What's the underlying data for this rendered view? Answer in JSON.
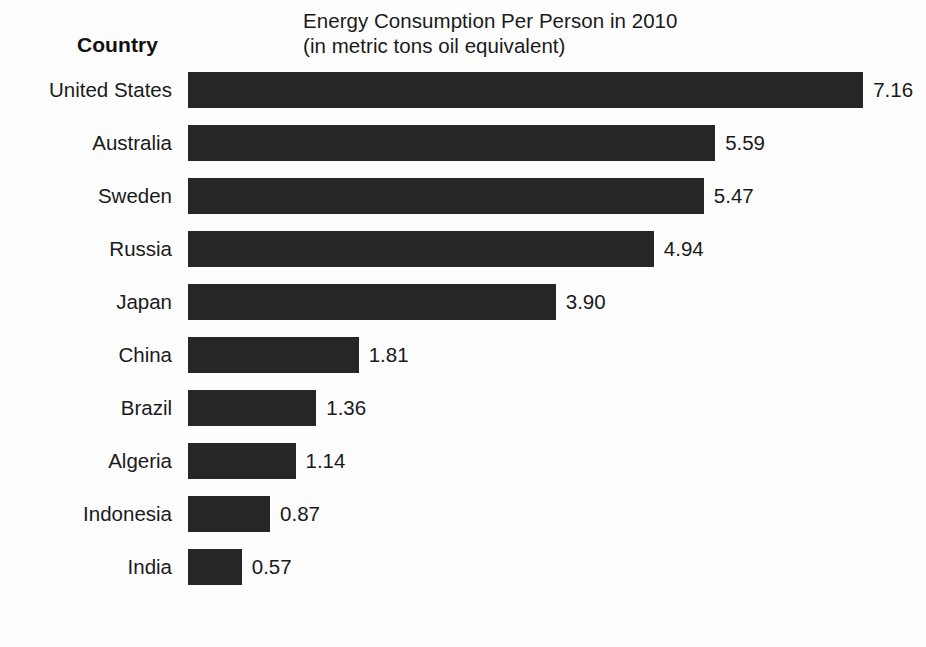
{
  "header": {
    "axis_header": "Country",
    "title_line1": "Energy Consumption Per Person in 2010",
    "title_line2": "(in metric tons oil equivalent)"
  },
  "style": {
    "bar_color": "#262626",
    "background_color": "#fdfdfd",
    "text_color": "#1a1a1a"
  },
  "chart_data": {
    "type": "bar",
    "orientation": "horizontal",
    "title": "Energy Consumption Per Person in 2010",
    "subtitle": "(in metric tons oil equivalent)",
    "xlabel": "",
    "ylabel": "Country",
    "grid": false,
    "legend": false,
    "axis_visible": false,
    "value_labels": true,
    "xlim": [
      0,
      7.16
    ],
    "categories": [
      "United States",
      "Australia",
      "Sweden",
      "Russia",
      "Japan",
      "China",
      "Brazil",
      "Algeria",
      "Indonesia",
      "India"
    ],
    "values": [
      7.16,
      5.59,
      5.47,
      4.94,
      3.9,
      1.81,
      1.36,
      1.14,
      0.87,
      0.57
    ],
    "value_labels_text": [
      "7.16",
      "5.59",
      "5.47",
      "4.94",
      "3.90",
      "1.81",
      "1.36",
      "1.14",
      "0.87",
      "0.57"
    ],
    "units": "metric tons oil equivalent per person",
    "rows": [
      {
        "label": "United States",
        "value": 7.16,
        "value_text": "7.16"
      },
      {
        "label": "Australia",
        "value": 5.59,
        "value_text": "5.59"
      },
      {
        "label": "Sweden",
        "value": 5.47,
        "value_text": "5.47"
      },
      {
        "label": "Russia",
        "value": 4.94,
        "value_text": "4.94"
      },
      {
        "label": "Japan",
        "value": 3.9,
        "value_text": "3.90"
      },
      {
        "label": "China",
        "value": 1.81,
        "value_text": "1.81"
      },
      {
        "label": "Brazil",
        "value": 1.36,
        "value_text": "1.36"
      },
      {
        "label": "Algeria",
        "value": 1.14,
        "value_text": "1.14"
      },
      {
        "label": "Indonesia",
        "value": 0.87,
        "value_text": "0.87"
      },
      {
        "label": "India",
        "value": 0.57,
        "value_text": "0.57"
      }
    ]
  },
  "layout": {
    "bar_origin_x": 188,
    "pixels_per_unit": 94.3,
    "bar_height": 36,
    "bar_gap": 17
  }
}
